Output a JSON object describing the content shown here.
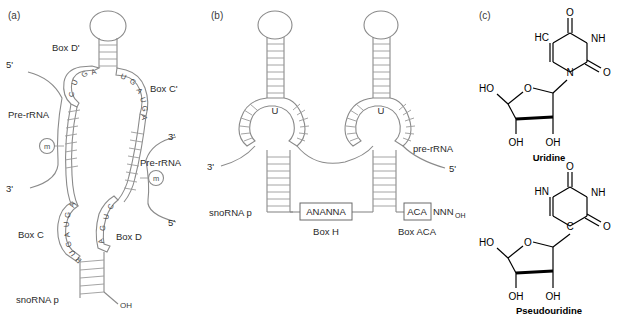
{
  "figure": {
    "panels": [
      {
        "id": "a",
        "label": "(a)",
        "type": "box-cd-snorna",
        "labels": {
          "box_d_prime": "Box D'",
          "box_c_prime": "Box C'",
          "box_c": "Box C",
          "box_d": "Box D",
          "pre_rrna_left": "Pre-rRNA",
          "pre_rrna_right": "Pre-rRNA",
          "five_prime_left": "5'",
          "three_prime_left": "3'",
          "three_prime_right": "3'",
          "five_prime_right": "5'",
          "snorna_p": "snoRNA p",
          "oh": "OH",
          "methyl_left": "m",
          "methyl_right": "m"
        },
        "sequences": {
          "box_d_prime": "CUGA",
          "box_c_prime": "UGAUGA",
          "box_c": "AGUAGUR",
          "box_d": "CUGA"
        }
      },
      {
        "id": "b",
        "label": "(b)",
        "type": "h-aca-snorna",
        "labels": {
          "three_prime": "3'",
          "five_prime": "5'",
          "pre_rrna": "pre-rRNA",
          "snorna_p": "snoRNA p",
          "box_h_caption": "Box H",
          "box_aca_caption": "Box ACA",
          "uridine_left": "U",
          "uridine_right": "U"
        },
        "sequences": {
          "box_h": "ANANNA",
          "box_aca": "ACA",
          "trailing_n": "NNN",
          "trailing_oh": "OH"
        }
      },
      {
        "id": "c",
        "label": "(c)",
        "type": "chemical-structures",
        "structures": [
          {
            "name": "Uridine",
            "bond_type": "N-glycosidic",
            "ring_atoms": [
              "HC",
              "NH",
              "N",
              "O",
              "O"
            ],
            "sugar_labels": [
              "HO",
              "O",
              "OH",
              "OH"
            ]
          },
          {
            "name": "Pseudouridine",
            "bond_type": "C-glycosidic",
            "ring_atoms": [
              "HN",
              "NH",
              "C",
              "O",
              "O"
            ],
            "sugar_labels": [
              "HO",
              "O",
              "OH",
              "OH"
            ]
          }
        ]
      }
    ]
  },
  "colors": {
    "rna_line": "#8a8a8a",
    "chem_line": "#000000",
    "text": "#2a2a2a",
    "background": "#ffffff"
  }
}
